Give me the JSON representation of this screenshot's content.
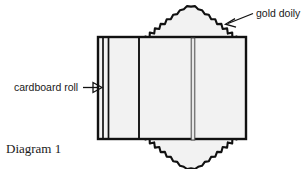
{
  "diagram": {
    "caption": "Diagram 1",
    "labels": {
      "cardboard_roll": "cardboard roll",
      "gold_doily": "gold doily"
    },
    "colors": {
      "outline": "#111111",
      "body_fill": "#f2f2f2",
      "doily_fill": "#f2f2f2",
      "background": "#ffffff",
      "text": "#1a1a1a"
    },
    "parts": [
      {
        "name": "cardboard-roll-body",
        "shape": "rectangle",
        "x": 97,
        "y": 36,
        "width": 150,
        "height": 104
      },
      {
        "name": "roll-wall-line-1",
        "shape": "vertical-line",
        "x": 102,
        "y1": 36,
        "y2": 140
      },
      {
        "name": "roll-wall-line-2",
        "shape": "vertical-line",
        "x": 107,
        "y1": 36,
        "y2": 140
      },
      {
        "name": "roll-seam-line",
        "shape": "vertical-line",
        "x": 139,
        "y1": 36,
        "y2": 140
      },
      {
        "name": "doily-center-bar",
        "shape": "vertical-bar",
        "x": 192,
        "y1": 38,
        "y2": 140,
        "width": 4
      },
      {
        "name": "gold-doily-top",
        "shape": "scalloped-dome",
        "orientation": "up",
        "cx": 191,
        "base_y": 41,
        "rx": 47,
        "ry": 33,
        "scallops": 22
      },
      {
        "name": "gold-doily-bottom",
        "shape": "scalloped-dome",
        "orientation": "down",
        "cx": 191,
        "base_y": 135,
        "rx": 47,
        "ry": 33,
        "scallops": 22
      }
    ],
    "leaders": [
      {
        "name": "cardboard-roll-leader",
        "from_x": 83,
        "from_y": 87,
        "to_x": 101,
        "to_y": 87,
        "arrow": "right"
      },
      {
        "name": "gold-doily-leader",
        "from_x": 252,
        "from_y": 14,
        "to_x": 226,
        "to_y": 24,
        "arrow": "down-left"
      }
    ],
    "text_positions": {
      "cardboard_roll": {
        "x": 14,
        "y": 91
      },
      "gold_doily": {
        "x": 256,
        "y": 16
      },
      "caption": {
        "x": 6,
        "y": 152
      }
    }
  }
}
